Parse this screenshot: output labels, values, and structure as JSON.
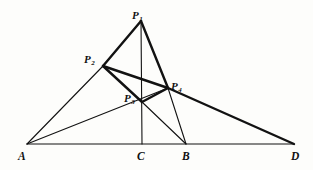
{
  "figure": {
    "stroke_color": "#121212",
    "background_color": "#fdfdfb",
    "labels": {
      "P1": {
        "base": "P",
        "sub": "1",
        "x": 132,
        "y": 6
      },
      "P2": {
        "base": "P",
        "sub": "2",
        "x": 84,
        "y": 50
      },
      "P3": {
        "base": "P",
        "sub": "3",
        "x": 124,
        "y": 89
      },
      "P4": {
        "base": "P",
        "sub": "4",
        "x": 171,
        "y": 77
      },
      "A": {
        "base": "A",
        "sub": "",
        "x": 18,
        "y": 147
      },
      "C": {
        "base": "C",
        "sub": "",
        "x": 137,
        "y": 147
      },
      "B": {
        "base": "B",
        "sub": "",
        "x": 182,
        "y": 147
      },
      "D": {
        "base": "D",
        "sub": "",
        "x": 291,
        "y": 147
      }
    },
    "points": {
      "P1": {
        "x": 141,
        "y": 21
      },
      "P2": {
        "x": 103,
        "y": 66
      },
      "P3": {
        "x": 142,
        "y": 102
      },
      "P4": {
        "x": 168,
        "y": 88
      },
      "A": {
        "x": 27,
        "y": 144
      },
      "C": {
        "x": 142,
        "y": 144
      },
      "B": {
        "x": 186,
        "y": 144
      },
      "D": {
        "x": 294,
        "y": 144
      }
    },
    "segments": [
      {
        "name": "baseline-A-D",
        "from": "A",
        "to": "D",
        "weight": "thin"
      },
      {
        "name": "altitude-C-P1",
        "from": "C",
        "to": "P1",
        "weight": "thin"
      },
      {
        "name": "edge-P1-P2",
        "from": "P1",
        "to": "P2",
        "weight": "thick"
      },
      {
        "name": "edge-P1-P4",
        "from": "P1",
        "to": "P4",
        "weight": "thick"
      },
      {
        "name": "edge-P2-P4",
        "from": "P2",
        "to": "P4",
        "weight": "thick"
      },
      {
        "name": "edge-P2-P3",
        "from": "P2",
        "to": "P3",
        "weight": "thick"
      },
      {
        "name": "edge-P3-P4",
        "from": "P3",
        "to": "P4",
        "weight": "thick"
      },
      {
        "name": "edge-A-P2",
        "from": "A",
        "to": "P2",
        "weight": "thin"
      },
      {
        "name": "cevian-A-P4",
        "from": "A",
        "to": "P4",
        "weight": "thin"
      },
      {
        "name": "edge-P4-D",
        "from": "P4",
        "to": "D",
        "weight": "thick"
      },
      {
        "name": "cevian-B-P3",
        "from": "B",
        "to": "P3",
        "weight": "thin"
      },
      {
        "name": "cevian-B-P4",
        "from": "B",
        "to": "P4",
        "weight": "thin"
      }
    ]
  }
}
